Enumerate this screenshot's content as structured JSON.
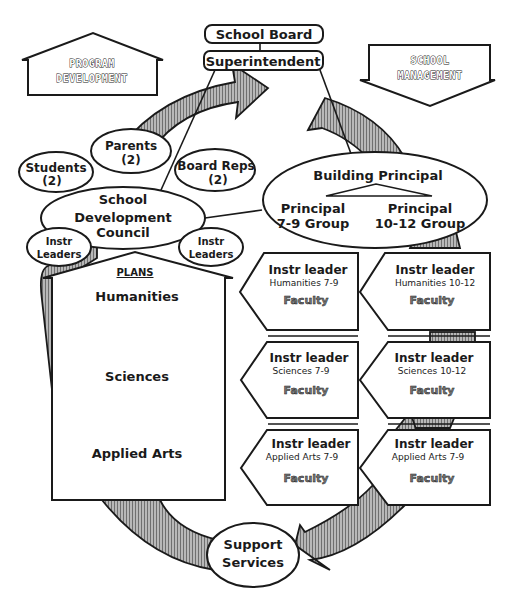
{
  "top_boxes": {
    "school_board": "School Board",
    "superintendent": "Superintendent"
  },
  "banners": {
    "program_development": [
      "PROGRAM",
      "DEVELOPMENT"
    ],
    "school_management": [
      "SCHOOL",
      "MANAGEMENT"
    ]
  },
  "council": {
    "title_lines": [
      "School",
      "Development",
      "Council"
    ],
    "members": {
      "students": [
        "Students",
        "(2)"
      ],
      "parents": [
        "Parents",
        "(2)"
      ],
      "board_reps": [
        "Board Reps",
        "(2)"
      ],
      "instr_leaders_left": [
        "Instr",
        "Leaders"
      ],
      "instr_leaders_right": [
        "Instr",
        "Leaders"
      ]
    }
  },
  "principal": {
    "title": "Building Principal",
    "left": [
      "Principal",
      "7-9 Group"
    ],
    "right": [
      "Principal",
      "10-12 Group"
    ]
  },
  "plans": {
    "heading": "PLANS",
    "items": [
      "Humanities",
      "Sciences",
      "Applied Arts"
    ]
  },
  "departments": [
    {
      "leader": "Instr leader",
      "subject": "Humanities 7-9",
      "faculty": "Faculty"
    },
    {
      "leader": "Instr leader",
      "subject": "Humanities 10-12",
      "faculty": "Faculty"
    },
    {
      "leader": "Instr leader",
      "subject": "Sciences  7-9",
      "faculty": "Faculty"
    },
    {
      "leader": "Instr leader",
      "subject": "Sciences  10-12",
      "faculty": "Faculty"
    },
    {
      "leader": "Instr leader",
      "subject": "Applied Arts  7-9",
      "faculty": "Faculty"
    },
    {
      "leader": "Instr leader",
      "subject": "Applied Arts  7-9",
      "faculty": "Faculty"
    }
  ],
  "support": [
    "Support",
    "Services"
  ],
  "colors": {
    "line": "#1a1a1a",
    "hatch": "#9a9a9a",
    "background": "#ffffff"
  }
}
